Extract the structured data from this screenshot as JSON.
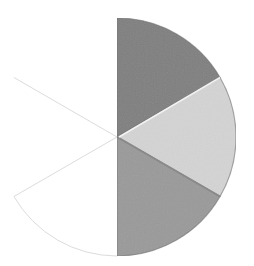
{
  "chart_data": {
    "type": "pie",
    "title": "",
    "legend": [],
    "total_parts": 6,
    "shaded_parts": 3,
    "fraction_shaded": "3/6",
    "center": [
      117,
      137
    ],
    "radius": 119,
    "slices": [
      {
        "label": "",
        "value": 1,
        "start_deg": -90,
        "end_deg": -30,
        "shaded": true,
        "fill": "#7f7f7f",
        "outline": true
      },
      {
        "label": "",
        "value": 1,
        "start_deg": -30,
        "end_deg": 30,
        "shaded": true,
        "fill": "#d4d4d4",
        "outline": true
      },
      {
        "label": "",
        "value": 1,
        "start_deg": 30,
        "end_deg": 90,
        "shaded": true,
        "fill": "#9a9a9a",
        "outline": true
      },
      {
        "label": "",
        "value": 1,
        "start_deg": 90,
        "end_deg": 150,
        "shaded": false,
        "fill": "#ffffff",
        "outline": "arc-only"
      },
      {
        "label": "",
        "value": 1,
        "start_deg": 150,
        "end_deg": 210,
        "shaded": false,
        "fill": "#ffffff",
        "outline": "none"
      },
      {
        "label": "",
        "value": 1,
        "start_deg": 210,
        "end_deg": 270,
        "shaded": false,
        "fill": "#ffffff",
        "outline": "none"
      }
    ],
    "colors": {
      "divider_faint": "#dcdcdc",
      "edge_dark": "#6a6a6a",
      "shadow_line": "#8a8a8a"
    }
  }
}
